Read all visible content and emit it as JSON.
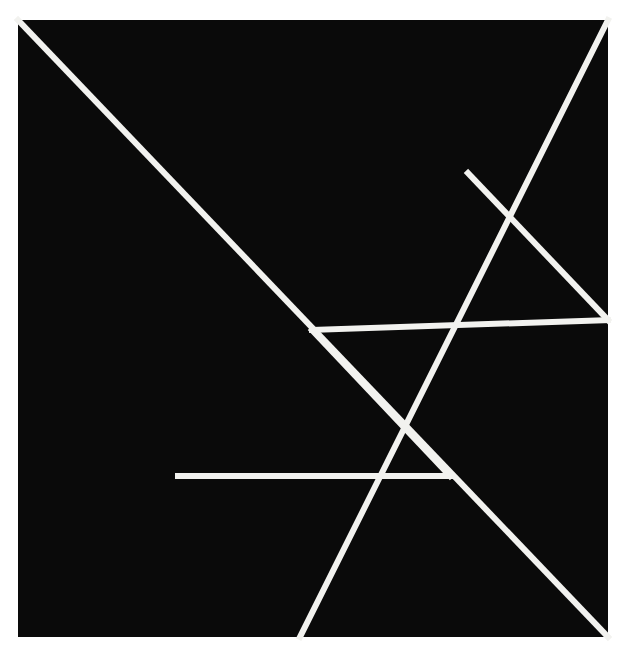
{
  "figure": {
    "name": "tangram-dissection",
    "canvas": {
      "width": 622,
      "height": 656
    },
    "colors": {
      "page_background": "#ffffff",
      "square_fill": "#0a0a0a",
      "line_stroke": "#f2f2ef"
    },
    "square": {
      "name": "outer-square",
      "left": 18,
      "top": 20,
      "right": 608,
      "bottom": 637,
      "width": 590,
      "height": 617
    },
    "line_width": 6,
    "vertices": [
      {
        "id": "top-left",
        "label": "A",
        "x": 18,
        "y": 20
      },
      {
        "id": "top-right",
        "label": "B",
        "x": 608,
        "y": 20
      },
      {
        "id": "bottom-right",
        "label": "C",
        "x": 608,
        "y": 637
      },
      {
        "id": "bottom-left",
        "label": "D",
        "x": 18,
        "y": 637
      },
      {
        "id": "center",
        "label": "E",
        "x": 312,
        "y": 330
      },
      {
        "id": "top-right-edge-mid",
        "label": "F",
        "x": 468,
        "y": 173
      },
      {
        "id": "right-edge-mid",
        "label": "G",
        "x": 608,
        "y": 320
      },
      {
        "id": "lower-junction",
        "label": "H",
        "x": 450,
        "y": 476
      },
      {
        "id": "horizontal-left-end",
        "label": "I",
        "x": 178,
        "y": 476
      },
      {
        "id": "bottom-edge-mid",
        "label": "J",
        "x": 300,
        "y": 637
      }
    ],
    "cut_lines": [
      {
        "id": "main-diagonal",
        "from": "top-left",
        "to": "bottom-right"
      },
      {
        "id": "anti-diagonal-upper",
        "from": "top-right",
        "to": "bottom-edge-mid"
      },
      {
        "id": "center-to-right-mid",
        "from": "center",
        "to": "right-edge-mid"
      },
      {
        "id": "topright-mid-to-right-mid",
        "from": "top-right-edge-mid",
        "to": "right-edge-mid"
      },
      {
        "id": "center-to-lower-junction",
        "from": "center",
        "to": "lower-junction"
      },
      {
        "id": "horizontal-cut",
        "from": "horizontal-left-end",
        "to": "lower-junction"
      }
    ],
    "pieces": [
      {
        "id": "large-triangle-upper-left",
        "label": "Large triangle 1"
      },
      {
        "id": "large-triangle-lower-left",
        "label": "Large triangle 2"
      },
      {
        "id": "medium-triangle-right",
        "label": "Medium triangle"
      },
      {
        "id": "small-triangle-top",
        "label": "Small triangle 1"
      },
      {
        "id": "small-triangle-bottom",
        "label": "Small triangle 2"
      },
      {
        "id": "square-piece",
        "label": "Square"
      },
      {
        "id": "parallelogram-piece",
        "label": "Parallelogram"
      }
    ]
  }
}
